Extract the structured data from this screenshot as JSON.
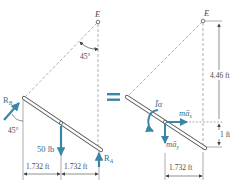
{
  "colors": {
    "force_arrow": "#3a86a8",
    "line": "#555555",
    "dashed": "#8a8a8a",
    "background": "#ffffff"
  },
  "left_panel": {
    "title": "free-body diagram",
    "point_label": "E",
    "angle_top": "45°",
    "angle_bottom": "45°",
    "force_rb_label": "R",
    "force_rb_sub": "B",
    "force_weight_label": "50 lb",
    "force_ra_label": "R",
    "force_ra_sub": "A",
    "dim_left": "1.732 ft",
    "dim_right": "1.732 ft"
  },
  "equals_sign": "=",
  "right_panel": {
    "title": "kinetic diagram",
    "point_label": "E",
    "dim_vertical_upper": "4.46 ft",
    "dim_vertical_lower": "1 ft",
    "dim_horizontal": "1.732 ft",
    "moment_label": "Īα",
    "inertia_x_label": "mā",
    "inertia_x_sub": "x",
    "inertia_y_label": "mā",
    "inertia_y_sub": "y"
  }
}
